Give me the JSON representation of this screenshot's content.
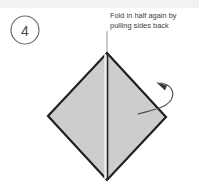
{
  "figure": {
    "kind": "origami-fold-instruction-step",
    "width": 199,
    "height": 193,
    "background_color": "#ffffff",
    "top_band_color": "#f2f2f2"
  },
  "step_marker": {
    "number": "4",
    "shape": "circle",
    "center_x": 25,
    "center_y": 30,
    "radius": 14,
    "stroke_color": "#6e6e6e",
    "text_color": "#4a4a4a"
  },
  "caption": {
    "line1": "Fold in half again by",
    "line2": "pulling sides back",
    "x": 110,
    "line1_y": 18,
    "line2_y": 28,
    "text_color": "#3b3b3b"
  },
  "leader_line": {
    "x1": 107,
    "y1": 31,
    "x2": 107,
    "y2": 54,
    "stroke_color": "#8a8a8a"
  },
  "diamond": {
    "label": "folded paper diamond",
    "apex_x": 107,
    "apex_y": 53,
    "left_x": 48,
    "left_y": 116,
    "right_x": 166,
    "right_y": 117,
    "bottom_x": 107,
    "bottom_y": 180,
    "fill_color": "#cdcdcd",
    "stroke_color": "#1f1f1f",
    "stroke_width": 2.2
  },
  "center_crease": {
    "label": "vertical center crease",
    "x1": 107,
    "y1": 53,
    "x2": 107,
    "y2": 180,
    "stroke_color": "#2a2a2a",
    "stroke_width": 1.5,
    "highlight_color": "#f0f0f0"
  },
  "curved_arrow": {
    "label": "pull side back arrow",
    "tail_x": 138,
    "tail_y": 114,
    "head_x": 158,
    "head_y": 84,
    "stroke_color": "#4d4d4d",
    "head_fill": "#3a3a3a",
    "direction": "curves right then points up-left"
  }
}
